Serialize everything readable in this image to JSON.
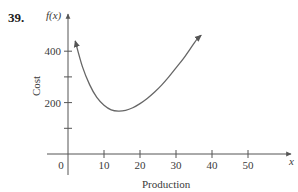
{
  "problem_number": "39.",
  "chart_data": {
    "type": "line",
    "title": "",
    "xlabel": "Production",
    "ylabel": "Cost",
    "x_axis_var": "x",
    "y_axis_var": "f(x)",
    "x_ticks": [
      0,
      10,
      20,
      30,
      40,
      50
    ],
    "x_tick_labels": [
      "0",
      "10",
      "20",
      "30",
      "40",
      "50"
    ],
    "y_ticks": [
      100,
      200,
      300,
      400
    ],
    "y_tick_labels": [
      "",
      "200",
      "",
      "400"
    ],
    "xlim": [
      -5,
      58
    ],
    "ylim": [
      -30,
      580
    ],
    "grid": false,
    "legend": null,
    "series": [
      {
        "name": "f(x)",
        "arrows_both_ends": true,
        "x": [
          2,
          4,
          6,
          8,
          10,
          12,
          14,
          16,
          18,
          20,
          22,
          24,
          26,
          28,
          30,
          32,
          34,
          36,
          37
        ],
        "y": [
          440,
          340,
          270,
          220,
          190,
          172,
          167,
          170,
          180,
          196,
          216,
          240,
          268,
          300,
          335,
          370,
          410,
          450,
          462
        ]
      }
    ]
  }
}
